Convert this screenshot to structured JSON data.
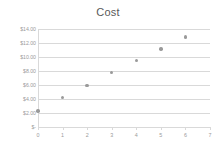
{
  "chart_data": {
    "type": "scatter",
    "title": "Cost",
    "xlabel": "",
    "ylabel": "",
    "x": [
      0,
      1,
      2,
      3,
      4,
      5,
      6
    ],
    "values": [
      2.3,
      4.2,
      5.95,
      7.8,
      9.5,
      11.15,
      12.85
    ],
    "series": [
      {
        "name": "Cost",
        "x": [
          0,
          1,
          2,
          3,
          4,
          5,
          6
        ],
        "values": [
          2.3,
          4.2,
          5.95,
          7.8,
          9.5,
          11.15,
          12.85
        ]
      }
    ],
    "xlim": [
      0,
      7
    ],
    "ylim": [
      0,
      14
    ],
    "x_tick_labels": [
      "0",
      "1",
      "2",
      "3",
      "4",
      "5",
      "6",
      "7"
    ],
    "x_tick_values": [
      0,
      1,
      2,
      3,
      4,
      5,
      6,
      7
    ],
    "y_tick_labels": [
      "$-",
      "$2.00",
      "$4.00",
      "$6.00",
      "$8.00",
      "$10.00",
      "$12.00",
      "$14.00"
    ],
    "y_tick_values": [
      0,
      2,
      4,
      6,
      8,
      10,
      12,
      14
    ],
    "grid": true,
    "grid_axis": "y",
    "legend": false,
    "legend_position": "none",
    "marker_color": "#9a9a9a",
    "gridline_color": "#d9d9d9",
    "title_color": "#595959",
    "tick_label_color": "#9b9b9b",
    "background_color": "#ffffff"
  }
}
